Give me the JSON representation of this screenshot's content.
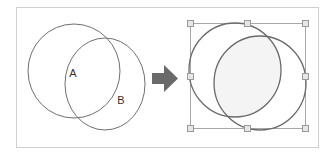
{
  "diagram": {
    "frame": {
      "x": 16,
      "y": 7,
      "width": 302,
      "height": 140,
      "stroke": "#cfcfcf"
    },
    "before_panel": {
      "circles": [
        {
          "id": "A",
          "cx": 74,
          "cy": 71,
          "rx": 46,
          "ry": 47,
          "stroke": "#707070"
        },
        {
          "id": "B",
          "cx": 105,
          "cy": 84,
          "rx": 40,
          "ry": 46,
          "stroke": "#707070"
        }
      ],
      "labels": [
        {
          "text": "A",
          "x": 73,
          "y": 77
        },
        {
          "text": "B",
          "x": 121,
          "y": 104
        }
      ]
    },
    "arrow": {
      "direction": "right",
      "color": "#6a6a6a",
      "icon": "right-arrow-icon"
    },
    "after_panel": {
      "circles": [
        {
          "id": "A",
          "cx": 235,
          "cy": 70,
          "rx": 46,
          "ry": 47,
          "stroke": "#6a6a6a"
        },
        {
          "id": "B",
          "cx": 260,
          "cy": 83,
          "rx": 46,
          "ry": 47,
          "stroke": "#6a6a6a"
        }
      ],
      "intersection_fill": "#f4f4f4",
      "selection_box": {
        "x": 190,
        "y": 23,
        "width": 115,
        "height": 105,
        "stroke": "#a8a8a8"
      },
      "handles": [
        {
          "position": "top-left",
          "x": 190,
          "y": 23
        },
        {
          "position": "top-center",
          "x": 247,
          "y": 23
        },
        {
          "position": "top-right",
          "x": 305,
          "y": 23
        },
        {
          "position": "middle-left",
          "x": 190,
          "y": 76
        },
        {
          "position": "middle-right",
          "x": 305,
          "y": 76
        },
        {
          "position": "bottom-left",
          "x": 190,
          "y": 128
        },
        {
          "position": "bottom-center",
          "x": 247,
          "y": 128
        },
        {
          "position": "bottom-right",
          "x": 305,
          "y": 128
        }
      ],
      "handle_style": {
        "size": 6,
        "fill": "#e6e6e6",
        "stroke": "#9a9a9a"
      }
    }
  }
}
